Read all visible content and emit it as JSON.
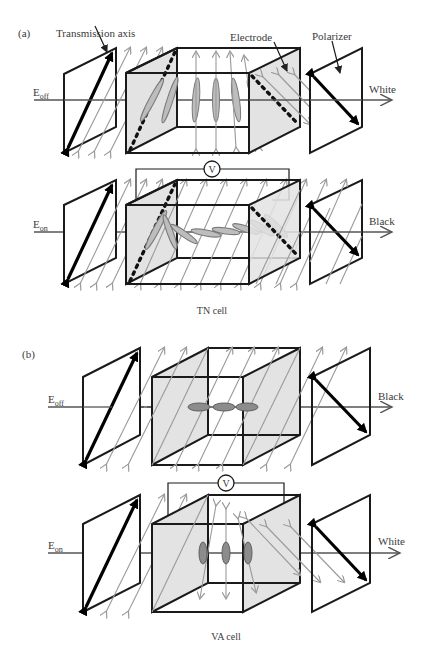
{
  "figure": {
    "top_cutoff_text": "",
    "panel_a": {
      "label": "(a)",
      "caption": "TN cell",
      "annotations": {
        "transmission_axis": "Transmission axis",
        "electrode": "Electrode",
        "polarizer": "Polarizer"
      },
      "rows": [
        {
          "field_label_main": "E",
          "field_label_sub": "off",
          "output": "White",
          "voltage_label": ""
        },
        {
          "field_label_main": "E",
          "field_label_sub": "on",
          "output": "Black",
          "voltage_label": "V"
        }
      ]
    },
    "panel_b": {
      "label": "(b)",
      "caption": "VA cell",
      "rows": [
        {
          "field_label_main": "E",
          "field_label_sub": "off",
          "output": "Black",
          "voltage_label": ""
        },
        {
          "field_label_main": "E",
          "field_label_sub": "on",
          "output": "White",
          "voltage_label": "V"
        }
      ]
    },
    "colors": {
      "line": "#1a1a1a",
      "electrode_fill": "#e3e3e3",
      "light_ray": "#9a9a9a",
      "liquid_crystal": "#bdbdbd"
    }
  }
}
